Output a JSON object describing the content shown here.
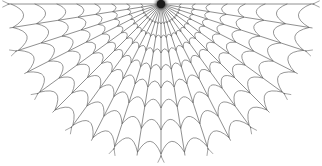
{
  "image": {
    "title": "Spider Web",
    "subject": "spider-web-line-drawing",
    "width": 322,
    "height": 166,
    "background_color": "#ffffff"
  },
  "web": {
    "hub": {
      "x": 161,
      "y": 4,
      "radius": 4.2,
      "color": "#1a1a1a",
      "glow_radius": 9
    },
    "stroke": {
      "spoke_color": "#4a4a4a",
      "ring_color": "#555555",
      "anchor_color": "#5a5a5a",
      "spoke_width": 0.62,
      "ring_width": 0.62,
      "anchor_width": 0.55
    },
    "geometry": {
      "spoke_count": 21,
      "ring_count": 8,
      "start_angle_deg": 180,
      "end_angle_deg": 0,
      "sag_factor": 0.16
    },
    "spoke_angles_deg": [
      180,
      171,
      162,
      153,
      144,
      135,
      126,
      117,
      108,
      99,
      90,
      81,
      72,
      63,
      54,
      45,
      36,
      27,
      18,
      9,
      0
    ],
    "ring_radii": [
      20,
      34,
      49,
      66,
      84,
      104,
      126,
      150
    ],
    "ring_radii_note": "distance in px from hub along each spoke; spacing widens outward",
    "anchor_stub_length": 7
  }
}
